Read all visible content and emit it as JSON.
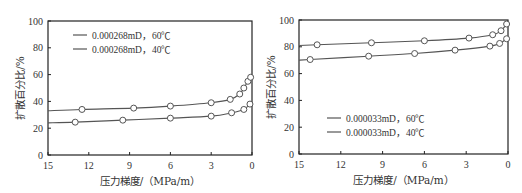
{
  "chart_data": [
    {
      "type": "line",
      "title": "",
      "xlabel": "压力梯度/（MPa/m）",
      "ylabel": "扩散百分比/%",
      "xlim": [
        15,
        0
      ],
      "ylim": [
        0,
        100
      ],
      "x_reversed": true,
      "xticks": [
        15,
        12,
        9,
        6,
        3,
        0
      ],
      "yticks": [
        0,
        20,
        40,
        60,
        80,
        100
      ],
      "grid": false,
      "legend_position": "upper-left",
      "series": [
        {
          "name": "0.000268mD，60℃",
          "x": [
            15,
            12.5,
            8.7,
            6.0,
            3.0,
            1.6,
            0.9,
            0.6,
            0.3,
            0.1
          ],
          "y": [
            33,
            34,
            35,
            36.5,
            39,
            41.5,
            45.5,
            50,
            55,
            58
          ],
          "markers": [
            false,
            true,
            true,
            true,
            true,
            true,
            true,
            true,
            true,
            true
          ]
        },
        {
          "name": "0.000268mD，40℃",
          "x": [
            15,
            13.0,
            9.5,
            6.0,
            3.0,
            1.5,
            0.6,
            0.15
          ],
          "y": [
            24,
            24.5,
            26,
            27.5,
            29,
            31.5,
            34,
            38
          ],
          "markers": [
            false,
            true,
            true,
            true,
            true,
            true,
            true,
            true
          ]
        }
      ]
    },
    {
      "type": "line",
      "title": "",
      "xlabel": "压力梯度/（MPa/m）",
      "ylabel": "扩散百分比/%",
      "xlim": [
        15,
        0
      ],
      "ylim": [
        0,
        100
      ],
      "x_reversed": true,
      "xticks": [
        15,
        12,
        9,
        6,
        3,
        0
      ],
      "yticks": [
        0,
        20,
        40,
        60,
        80,
        100
      ],
      "grid": false,
      "legend_position": "lower-left",
      "series": [
        {
          "name": "0.000033mD，60℃",
          "x": [
            15,
            13.7,
            9.8,
            6.0,
            2.8,
            1.1,
            0.5,
            0.1
          ],
          "y": [
            81,
            81.5,
            83,
            84.5,
            86.5,
            89,
            92,
            97
          ],
          "markers": [
            false,
            true,
            true,
            true,
            true,
            true,
            true,
            true
          ]
        },
        {
          "name": "0.000033mD，40℃",
          "x": [
            15,
            14.2,
            10.0,
            6.7,
            3.8,
            1.3,
            0.6,
            0.1
          ],
          "y": [
            70,
            70.5,
            73,
            75,
            77.5,
            80.5,
            82.5,
            86
          ],
          "markers": [
            false,
            true,
            true,
            true,
            true,
            true,
            true,
            true
          ]
        }
      ]
    }
  ],
  "colors": {
    "line": "#555555",
    "frame": "#222222",
    "marker_fill": "#ffffff",
    "text": "#333333"
  },
  "layout": [
    {
      "frame": {
        "x0": 48,
        "x1": 252,
        "y0": 21,
        "y1": 155
      },
      "legend": {
        "x": 73,
        "y": 35,
        "dy": 14
      }
    },
    {
      "frame": {
        "x0": 38,
        "x1": 247,
        "y0": 20,
        "y1": 154
      },
      "legend": {
        "x": 66,
        "y": 118,
        "dy": 14
      }
    }
  ]
}
